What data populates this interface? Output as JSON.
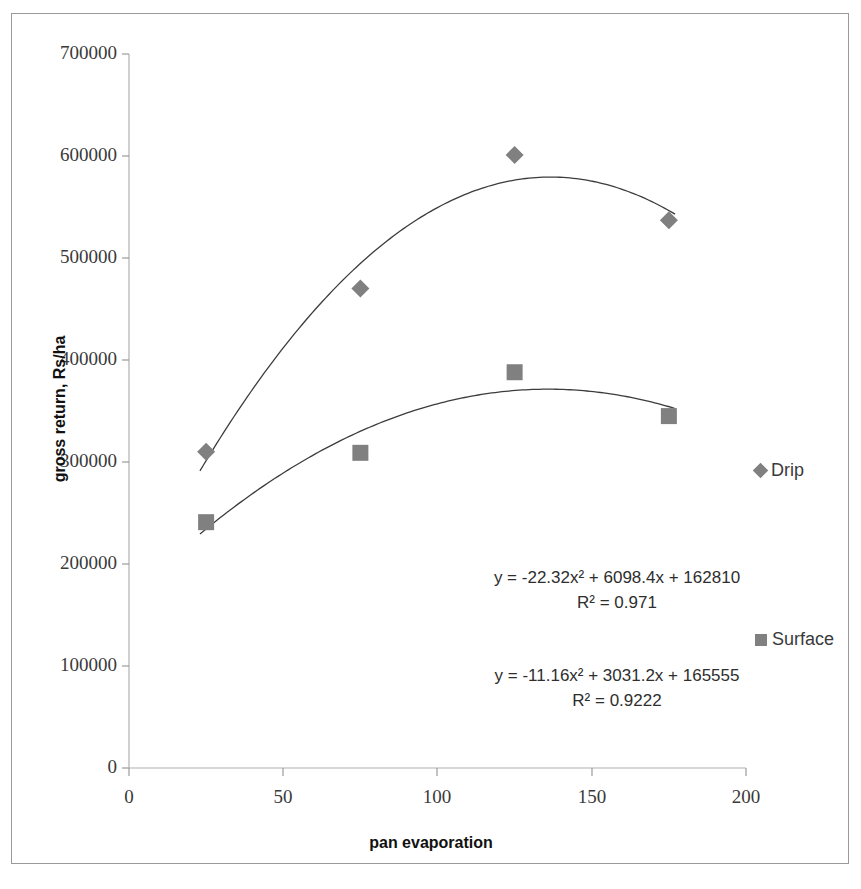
{
  "chart_data": {
    "type": "scatter",
    "title": "",
    "xlabel": "pan evaporation",
    "ylabel": "gross return, Rs/ha",
    "xlim": [
      0,
      200
    ],
    "ylim": [
      0,
      700000
    ],
    "x_ticks": [
      "0",
      "50",
      "100",
      "150",
      "200"
    ],
    "x_tick_values": [
      0,
      50,
      100,
      150,
      200
    ],
    "y_ticks": [
      "0",
      "100000",
      "200000",
      "300000",
      "400000",
      "500000",
      "600000",
      "700000"
    ],
    "y_tick_values": [
      0,
      100000,
      200000,
      300000,
      400000,
      500000,
      600000,
      700000
    ],
    "grid": false,
    "legend_position": "right",
    "x": [
      25,
      75,
      125,
      175
    ],
    "series": [
      {
        "name": "Drip",
        "marker": "diamond",
        "color": "#808080",
        "values": [
          310000,
          470000,
          601000,
          537000
        ],
        "trendline": {
          "type": "polynomial-2",
          "a": -22.32,
          "b": 6098.4,
          "c": 162810,
          "equation": "y = -22.32x² + 6098.4x + 162810",
          "r2_label": "R² = 0.971",
          "r2": 0.971
        }
      },
      {
        "name": "Surface",
        "marker": "square",
        "color": "#808080",
        "values": [
          241000,
          309000,
          388000,
          345000
        ],
        "trendline": {
          "type": "polynomial-2",
          "a": -11.16,
          "b": 3031.2,
          "c": 165555,
          "equation": "y = -11.16x² + 3031.2x + 165555",
          "r2_label": "R² = 0.9222",
          "r2": 0.9222
        }
      }
    ]
  },
  "axes": {
    "y_title": "gross return, Rs/ha",
    "x_title": "pan evaporation",
    "y_labels": [
      "700000",
      "600000",
      "500000",
      "400000",
      "300000",
      "200000",
      "100000",
      "0"
    ],
    "x_labels": [
      "0",
      "50",
      "100",
      "150",
      "200"
    ]
  },
  "legend": {
    "drip_label": "Drip",
    "surface_label": "Surface"
  },
  "annotations": {
    "drip_equation": "y = -22.32x² + 6098.4x + 162810",
    "drip_r2": "R² = 0.971",
    "surface_equation": "y = -11.16x² + 3031.2x + 165555",
    "surface_r2": "R² = 0.9222"
  },
  "colors": {
    "marker": "#808080",
    "trendline": "#3c3c3c",
    "axis": "#9a9a9a",
    "text": "#2e2e2e"
  }
}
